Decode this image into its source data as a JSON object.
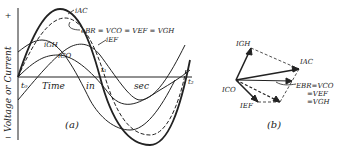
{
  "panel_a": {
    "caption": "(a)",
    "y_axis_label": "Voltage or Current",
    "y_plus": "+",
    "y_minus": "−",
    "x_words": [
      "Time",
      "in",
      "sec"
    ],
    "t0": "t₀",
    "t1": "t₁",
    "t2": "t₂",
    "curves": {
      "iac": "iAC",
      "ebr": "eBR = VCO = VEF = VGH",
      "igh": "iGH",
      "ico": "iCO",
      "ief": "iEF"
    }
  },
  "panel_b": {
    "caption": "(b)",
    "igh": "IGH",
    "iac": "IAC",
    "ico": "ICO",
    "ief": "IEF",
    "ebr_lines": [
      "EBR=VCO",
      "=VEF",
      "=VGH"
    ]
  },
  "colors": {
    "ink": "#222222",
    "paper": "#ffffff"
  }
}
